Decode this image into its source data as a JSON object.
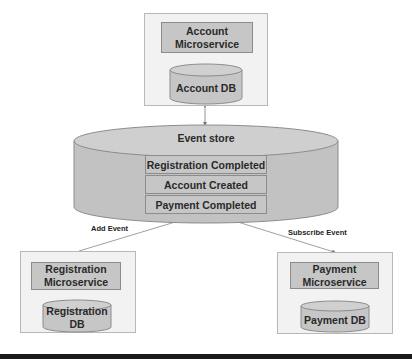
{
  "account": {
    "service_label": "Account Microservice",
    "db_label": "Account DB"
  },
  "event_store": {
    "title": "Event store",
    "events": [
      "Registration Completed",
      "Account Created",
      "Payment Completed"
    ]
  },
  "registration": {
    "service_label": "Registration Microservice",
    "db_label": "Registration DB"
  },
  "payment": {
    "service_label": "Payment Microservice",
    "db_label": "Payment DB"
  },
  "arrows": {
    "add_event": "Add Event",
    "subscribe_event": "Subscribe Event"
  },
  "colors": {
    "panel": "#f2f2f2",
    "box": "#c6c6c6",
    "cylinder": "#c6c6c6",
    "border": "#8c8c8c"
  }
}
